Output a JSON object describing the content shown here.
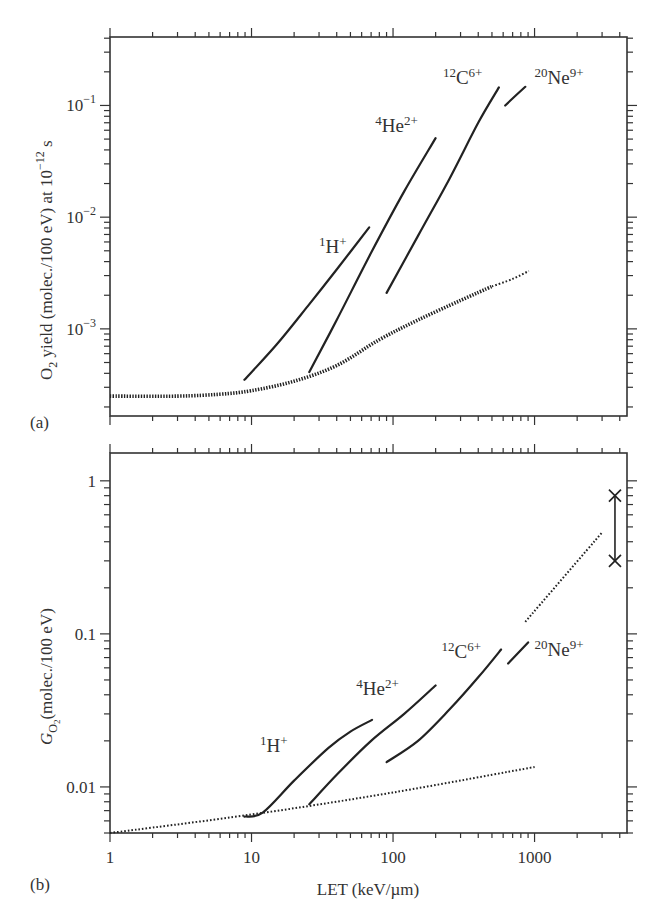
{
  "chart_data": [
    {
      "panel": "a",
      "type": "line",
      "panel_label": "(a)",
      "title": "",
      "xlabel": "",
      "ylabel": "O2 yield (molec./100 eV) at 10^-12 s",
      "ylabel_parts": {
        "pre": "O",
        "sub": "2",
        "mid": " yield (molec./100 eV) at 10",
        "sup": "−12",
        "post": " s"
      },
      "xscale": "log",
      "yscale": "log",
      "xlim": [
        1,
        4500
      ],
      "ylim": [
        0.000166,
        0.41
      ],
      "xticks_major": [
        1,
        10,
        100,
        1000
      ],
      "yticks": [
        {
          "value": 0.1,
          "base": "10",
          "exp": "−1"
        },
        {
          "value": 0.01,
          "base": "10",
          "exp": "−2"
        },
        {
          "value": 0.001,
          "base": "10",
          "exp": "−3"
        }
      ],
      "grid": false,
      "series": [
        {
          "name": "1H+",
          "label_pre": "1",
          "label_main": "H",
          "label_sup": "+",
          "style": "solid",
          "points": [
            [
              8.9,
              0.00035
            ],
            [
              15,
              0.00072
            ],
            [
              25,
              0.0016
            ],
            [
              40,
              0.0034
            ],
            [
              67.8,
              0.0081
            ]
          ],
          "label_at": [
            30,
            0.0048
          ]
        },
        {
          "name": "4He2+",
          "label_pre": "4",
          "label_main": "He",
          "label_sup": "2+",
          "style": "solid",
          "points": [
            [
              25.6,
              0.00041
            ],
            [
              40,
              0.0012
            ],
            [
              70,
              0.0048
            ],
            [
              120,
              0.017
            ],
            [
              200,
              0.051
            ]
          ],
          "label_at": [
            75,
            0.058
          ]
        },
        {
          "name": "12C6+",
          "label_pre": "12",
          "label_main": "C",
          "label_sup": "6+",
          "style": "solid",
          "points": [
            [
              90,
              0.0021
            ],
            [
              150,
              0.0068
            ],
            [
              250,
              0.022
            ],
            [
              400,
              0.07
            ],
            [
              560,
              0.145
            ]
          ],
          "label_at": [
            225,
            0.155
          ]
        },
        {
          "name": "20Ne9+",
          "label_pre": "20",
          "label_main": "Ne",
          "label_sup": "9+",
          "style": "solid",
          "points": [
            [
              620,
              0.1
            ],
            [
              860,
              0.147
            ]
          ],
          "label_at": [
            1000,
            0.155
          ]
        },
        {
          "name": "dotted-reference",
          "style": "dotted-thick",
          "points": [
            [
              1,
              0.00025
            ],
            [
              3,
              0.00025
            ],
            [
              6,
              0.00026
            ],
            [
              10,
              0.00028
            ],
            [
              20,
              0.00034
            ],
            [
              40,
              0.00047
            ],
            [
              80,
              0.0008
            ],
            [
              150,
              0.0012
            ],
            [
              300,
              0.0018
            ],
            [
              500,
              0.0024
            ]
          ]
        },
        {
          "name": "dotted-reference-tail",
          "style": "dotted",
          "points": [
            [
              500,
              0.0024
            ],
            [
              700,
              0.0028
            ],
            [
              910,
              0.0033
            ]
          ]
        }
      ]
    },
    {
      "panel": "b",
      "type": "line",
      "panel_label": "(b)",
      "title": "",
      "xlabel": "LET (keV/µm)",
      "ylabel": "G_O2 (molec./100 eV)",
      "ylabel_parts": {
        "pre": "G",
        "sub": "O",
        "subsub": "2",
        "post": "(molec./100 eV)"
      },
      "xscale": "log",
      "yscale": "log",
      "xlim": [
        1,
        4500
      ],
      "ylim": [
        0.005,
        1.52
      ],
      "xticks": [
        {
          "value": 1,
          "label": "1"
        },
        {
          "value": 10,
          "label": "10"
        },
        {
          "value": 100,
          "label": "100"
        },
        {
          "value": 1000,
          "label": "1000"
        }
      ],
      "yticks": [
        {
          "value": 1,
          "label": "1"
        },
        {
          "value": 0.1,
          "label": "0.1"
        },
        {
          "value": 0.01,
          "label": "0.01"
        }
      ],
      "grid": false,
      "series": [
        {
          "name": "1H+",
          "label_pre": "1",
          "label_main": "H",
          "label_sup": "+",
          "style": "solid",
          "points": [
            [
              8.9,
              0.0064
            ],
            [
              12,
              0.0068
            ],
            [
              20,
              0.011
            ],
            [
              35,
              0.018
            ],
            [
              50,
              0.023
            ],
            [
              71,
              0.0274
            ]
          ],
          "label_at": [
            11.5,
            0.017
          ]
        },
        {
          "name": "4He2+",
          "label_pre": "4",
          "label_main": "He",
          "label_sup": "2+",
          "style": "solid",
          "points": [
            [
              25.6,
              0.0077
            ],
            [
              40,
              0.012
            ],
            [
              70,
              0.02
            ],
            [
              120,
              0.03
            ],
            [
              200,
              0.046
            ]
          ],
          "label_at": [
            55,
            0.04
          ]
        },
        {
          "name": "12C6+",
          "label_pre": "12",
          "label_main": "C",
          "label_sup": "6+",
          "style": "solid",
          "points": [
            [
              90,
              0.0145
            ],
            [
              150,
              0.02
            ],
            [
              250,
              0.032
            ],
            [
              400,
              0.052
            ],
            [
              580,
              0.079
            ]
          ],
          "label_at": [
            220,
            0.07
          ]
        },
        {
          "name": "20Ne9+",
          "label_pre": "20",
          "label_main": "Ne",
          "label_sup": "9+",
          "style": "solid",
          "points": [
            [
              650,
              0.064
            ],
            [
              900,
              0.088
            ]
          ],
          "label_at": [
            1000,
            0.072
          ]
        },
        {
          "name": "dotted-reference",
          "style": "dotted",
          "points": [
            [
              1,
              0.005
            ],
            [
              10,
              0.0066
            ],
            [
              100,
              0.0092
            ],
            [
              1000,
              0.0135
            ]
          ]
        },
        {
          "name": "dotted-high-LET",
          "style": "dotted",
          "points": [
            [
              860,
              0.12
            ],
            [
              3000,
              0.46
            ]
          ]
        },
        {
          "name": "range-markers",
          "style": "x-markers",
          "points": [
            [
              3700,
              0.8
            ],
            [
              3700,
              0.3
            ]
          ]
        }
      ]
    }
  ]
}
